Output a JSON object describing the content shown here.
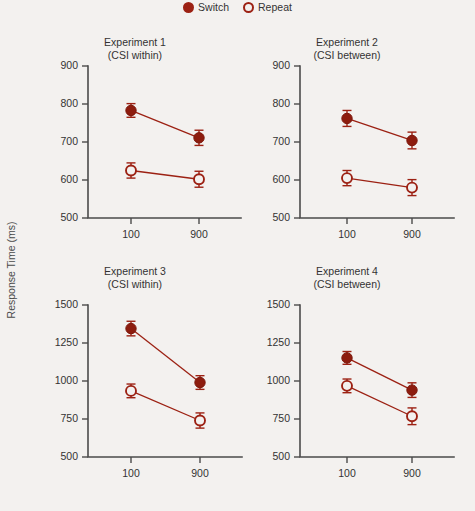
{
  "figure": {
    "ylabel": "Response Time (ms)",
    "accent_color": "#9c2113",
    "marker_fill_color": "#8d1c0e",
    "axis_color": "#4b4b4b",
    "background_color": "#f3f1ef"
  },
  "legend": {
    "position": "top-center",
    "entries": [
      {
        "label": "Switch",
        "marker": "filled-circle-icon"
      },
      {
        "label": "Repeat",
        "marker": "open-circle-icon"
      }
    ]
  },
  "chart_data": [
    {
      "type": "line",
      "title": "Experiment 1",
      "subtitle": "(CSI within)",
      "xlabel": "",
      "ylabel": "Response Time (ms)",
      "x": [
        100,
        900
      ],
      "xtick_labels": [
        "100",
        "900"
      ],
      "ylim": [
        500,
        900
      ],
      "yticks": [
        500,
        600,
        700,
        800,
        900
      ],
      "ytick_labels": [
        "500",
        "600",
        "700",
        "800",
        "900"
      ],
      "grid": false,
      "series": [
        {
          "name": "Switch",
          "marker": "filled-circle",
          "values": [
            783,
            711
          ],
          "errors": [
            18,
            20
          ]
        },
        {
          "name": "Repeat",
          "marker": "open-circle",
          "values": [
            625,
            602
          ],
          "errors": [
            20,
            21
          ]
        }
      ]
    },
    {
      "type": "line",
      "title": "Experiment 2",
      "subtitle": "(CSI between)",
      "xlabel": "",
      "ylabel": "Response Time (ms)",
      "x": [
        100,
        900
      ],
      "xtick_labels": [
        "100",
        "900"
      ],
      "ylim": [
        500,
        900
      ],
      "yticks": [
        500,
        600,
        700,
        800,
        900
      ],
      "ytick_labels": [
        "500",
        "600",
        "700",
        "800",
        "900"
      ],
      "grid": false,
      "series": [
        {
          "name": "Switch",
          "marker": "filled-circle",
          "values": [
            762,
            704
          ],
          "errors": [
            21,
            22
          ]
        },
        {
          "name": "Repeat",
          "marker": "open-circle",
          "values": [
            605,
            580
          ],
          "errors": [
            20,
            21
          ]
        }
      ]
    },
    {
      "type": "line",
      "title": "Experiment 3",
      "subtitle": "(CSI within)",
      "xlabel": "",
      "ylabel": "Response Time (ms)",
      "x": [
        100,
        900
      ],
      "xtick_labels": [
        "100",
        "900"
      ],
      "ylim": [
        500,
        1500
      ],
      "yticks": [
        500,
        750,
        1000,
        1250,
        1500
      ],
      "ytick_labels": [
        "500",
        "750",
        "1000",
        "1250",
        "1500"
      ],
      "grid": false,
      "series": [
        {
          "name": "Switch",
          "marker": "filled-circle",
          "values": [
            1345,
            990
          ],
          "errors": [
            48,
            45
          ]
        },
        {
          "name": "Repeat",
          "marker": "open-circle",
          "values": [
            935,
            740
          ],
          "errors": [
            45,
            50
          ]
        }
      ]
    },
    {
      "type": "line",
      "title": "Experiment 4",
      "subtitle": "(CSI between)",
      "xlabel": "",
      "ylabel": "Response Time (ms)",
      "x": [
        100,
        900
      ],
      "xtick_labels": [
        "100",
        "900"
      ],
      "ylim": [
        500,
        1500
      ],
      "yticks": [
        500,
        750,
        1000,
        1250,
        1500
      ],
      "ytick_labels": [
        "500",
        "750",
        "1000",
        "1250",
        "1500"
      ],
      "grid": false,
      "series": [
        {
          "name": "Switch",
          "marker": "filled-circle",
          "values": [
            1152,
            940
          ],
          "errors": [
            42,
            48
          ]
        },
        {
          "name": "Repeat",
          "marker": "open-circle",
          "values": [
            968,
            768
          ],
          "errors": [
            45,
            55
          ]
        }
      ]
    }
  ]
}
